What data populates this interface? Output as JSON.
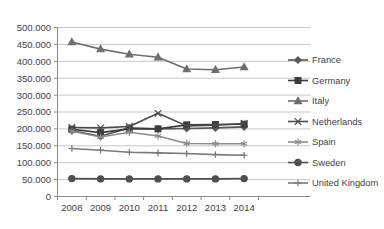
{
  "chart_data": {
    "type": "line",
    "title": "",
    "xlabel": "",
    "ylabel": "",
    "categories": [
      "2008",
      "2009",
      "2010",
      "2011",
      "2012",
      "2013",
      "2014"
    ],
    "ylim": [
      0,
      500000
    ],
    "ytick_values": [
      0,
      50000,
      100000,
      150000,
      200000,
      250000,
      300000,
      350000,
      400000,
      450000,
      500000
    ],
    "ytick_labels": [
      "0",
      "50.000",
      "100.000",
      "150.000",
      "200.000",
      "250.000",
      "300.000",
      "350.000",
      "400.000",
      "450.000",
      "500.000"
    ],
    "grid": true,
    "legend_position": "right",
    "series": [
      {
        "name": "France",
        "marker": "diamond",
        "color": "#595959",
        "values": [
          195000,
          178000,
          203000,
          200000,
          201000,
          203000,
          206000
        ]
      },
      {
        "name": "Germany",
        "marker": "square",
        "color": "#3c3c3c",
        "values": [
          199000,
          189000,
          200000,
          200000,
          212000,
          213000,
          214000
        ]
      },
      {
        "name": "Italy",
        "marker": "triangle",
        "color": "#6e6e6e",
        "values": [
          457000,
          436000,
          421000,
          412000,
          377000,
          375000,
          383000
        ]
      },
      {
        "name": "Netherlands",
        "marker": "cross",
        "color": "#4a4a4a",
        "values": [
          204000,
          203000,
          207000,
          246000,
          209000,
          211000,
          216000
        ]
      },
      {
        "name": "Spain",
        "marker": "asterisk",
        "color": "#8c8c8c",
        "values": [
          193000,
          176000,
          190000,
          179000,
          157000,
          156000,
          156000
        ]
      },
      {
        "name": "Sweden",
        "marker": "circle",
        "color": "#4f4f4f",
        "values": [
          53000,
          52000,
          52000,
          52000,
          52000,
          52000,
          53000
        ]
      },
      {
        "name": "United Kingdom",
        "marker": "plus",
        "color": "#7a7a7a",
        "values": [
          142000,
          137000,
          131000,
          129000,
          127000,
          124000,
          122000
        ]
      }
    ]
  },
  "legend": {
    "entries": [
      {
        "label": "France"
      },
      {
        "label": "Germany"
      },
      {
        "label": "Italy"
      },
      {
        "label": "Netherlands"
      },
      {
        "label": "Spain"
      },
      {
        "label": "Sweden"
      },
      {
        "label": "United Kingdom"
      }
    ]
  },
  "axes": {
    "y_labels": [
      "500.000",
      "450.000",
      "400.000",
      "350.000",
      "300.000",
      "250.000",
      "200.000",
      "150.000",
      "100.000",
      "50.000",
      "0"
    ],
    "x_labels": [
      "2008",
      "2009",
      "2010",
      "2011",
      "2012",
      "2013",
      "2014"
    ]
  }
}
